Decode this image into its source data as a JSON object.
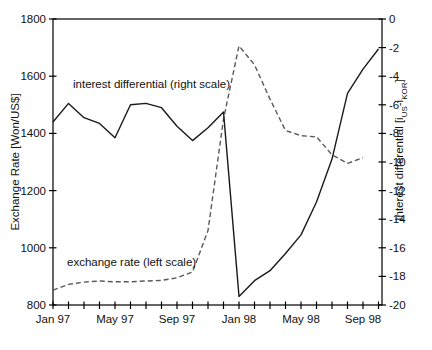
{
  "chart_data": {
    "type": "line",
    "title": "",
    "x": {
      "unit": "month",
      "categories": [
        "Jan 97",
        "Feb 97",
        "Mar 97",
        "Apr 97",
        "May 97",
        "Jun 97",
        "Jul 97",
        "Aug 97",
        "Sep 97",
        "Oct 97",
        "Nov 97",
        "Dec 97",
        "Jan 98",
        "Feb 98",
        "Mar 98",
        "Apr 98",
        "May 98",
        "Jun 98",
        "Jul 98",
        "Aug 98",
        "Sep 98",
        "Oct 98"
      ],
      "labeled_tick_indices": [
        0,
        4,
        8,
        12,
        16,
        20
      ],
      "labeled_ticks": [
        "Jan 97",
        "May 97",
        "Sep 97",
        "Jan 98",
        "May 98",
        "Sep 98"
      ]
    },
    "y_left": {
      "label": "Exchange Rate [Won/US$]",
      "min": 800,
      "max": 1800,
      "ticks": [
        1800,
        1600,
        1400,
        1200,
        1000,
        800
      ]
    },
    "y_right": {
      "label_parts": {
        "p1": "Interest differential [i",
        "sub1": "US",
        "p2": "-i",
        "sub2": "KOR",
        "p3": "]"
      },
      "min": -20,
      "max": 0,
      "ticks": [
        0,
        -2,
        -4,
        -6,
        -8,
        -10,
        -12,
        -14,
        -16,
        -18,
        -20
      ]
    },
    "grid": "off",
    "legend": "in-plot text annotations",
    "series": [
      {
        "name": "exchange rate",
        "axis": "left",
        "style": "dashed",
        "color": "#5a5a5a",
        "values": [
          852,
          872,
          880,
          884,
          881,
          881,
          884,
          886,
          895,
          915,
          1060,
          1450,
          1706,
          1640,
          1520,
          1410,
          1392,
          1388,
          1325,
          1295,
          1315
        ]
      },
      {
        "name": "interest differential",
        "axis": "right",
        "style": "solid",
        "color": "#1a1a1a",
        "values": [
          -7.2,
          -5.9,
          -6.9,
          -7.3,
          -8.3,
          -6.0,
          -5.9,
          -6.2,
          -7.5,
          -8.5,
          -7.6,
          -6.5,
          -19.4,
          -18.3,
          -17.6,
          -16.4,
          -15.1,
          -12.8,
          -9.8,
          -5.2,
          -3.5,
          -2.1
        ]
      }
    ],
    "annotations": [
      {
        "text": "interest differential (right scale)"
      },
      {
        "text": "exchange rate (left scale)"
      }
    ],
    "frame_color": "#000000"
  }
}
